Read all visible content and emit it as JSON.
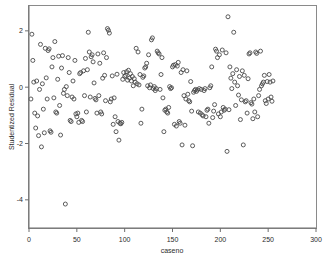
{
  "chart_data": {
    "type": "scatter",
    "title": "",
    "xlabel": "caseno",
    "ylabel": "Studentized Residual",
    "xlim": [
      0,
      300
    ],
    "ylim": [
      -5.0,
      2.9
    ],
    "xticks": [
      0,
      50,
      100,
      150,
      200,
      250,
      300
    ],
    "xtick_labels": [
      "0",
      "50",
      "100",
      "150",
      "200",
      "250",
      "300"
    ],
    "yticks": [
      2,
      0,
      -2,
      -4
    ],
    "ytick_labels": [
      "2",
      "0",
      "-2",
      "-4"
    ],
    "grid": false,
    "legend": null,
    "marker": "open-circle",
    "marker_color": "#4a4a4a",
    "marker_size": 4,
    "n_points": 250,
    "points": [
      [
        2,
        -0.42
      ],
      [
        3,
        1.88
      ],
      [
        4,
        0.95
      ],
      [
        5,
        0.18
      ],
      [
        6,
        -0.92
      ],
      [
        7,
        -1.45
      ],
      [
        8,
        0.22
      ],
      [
        9,
        -1.02
      ],
      [
        10,
        -1.72
      ],
      [
        11,
        -0.08
      ],
      [
        12,
        1.52
      ],
      [
        13,
        -2.12
      ],
      [
        14,
        0.12
      ],
      [
        15,
        -0.78
      ],
      [
        16,
        -1.62
      ],
      [
        17,
        1.38
      ],
      [
        18,
        0.33
      ],
      [
        19,
        -0.42
      ],
      [
        20,
        1.3
      ],
      [
        21,
        1.36
      ],
      [
        22,
        -1.55
      ],
      [
        23,
        -1.6
      ],
      [
        24,
        0.72
      ],
      [
        25,
        1.05
      ],
      [
        26,
        -0.38
      ],
      [
        27,
        1.62
      ],
      [
        28,
        -0.88
      ],
      [
        29,
        -0.92
      ],
      [
        30,
        0.28
      ],
      [
        31,
        1.1
      ],
      [
        32,
        -0.65
      ],
      [
        33,
        -1.7
      ],
      [
        34,
        0.68
      ],
      [
        35,
        1.12
      ],
      [
        36,
        -0.22
      ],
      [
        37,
        -0.08
      ],
      [
        38,
        -4.15
      ],
      [
        39,
        0.02
      ],
      [
        40,
        -0.3
      ],
      [
        41,
        1.05
      ],
      [
        42,
        0.52
      ],
      [
        43,
        -1.18
      ],
      [
        44,
        -1.22
      ],
      [
        45,
        -0.35
      ],
      [
        46,
        0.22
      ],
      [
        47,
        -0.42
      ],
      [
        48,
        0.95
      ],
      [
        49,
        -0.95
      ],
      [
        50,
        -1.05
      ],
      [
        51,
        -0.92
      ],
      [
        52,
        -1.25
      ],
      [
        53,
        0.48
      ],
      [
        54,
        0.52
      ],
      [
        55,
        -1.18
      ],
      [
        56,
        -1.22
      ],
      [
        57,
        0.58
      ],
      [
        58,
        -0.3
      ],
      [
        59,
        1.02
      ],
      [
        60,
        -0.88
      ],
      [
        61,
        0.62
      ],
      [
        62,
        1.95
      ],
      [
        63,
        1.25
      ],
      [
        64,
        -0.35
      ],
      [
        65,
        1.08
      ],
      [
        66,
        1.15
      ],
      [
        67,
        0.9
      ],
      [
        68,
        0.15
      ],
      [
        69,
        -0.4
      ],
      [
        70,
        -0.45
      ],
      [
        71,
        -0.92
      ],
      [
        72,
        1.18
      ],
      [
        73,
        -0.3
      ],
      [
        74,
        0.85
      ],
      [
        75,
        -0.88
      ],
      [
        76,
        -0.95
      ],
      [
        77,
        0.32
      ],
      [
        78,
        1.22
      ],
      [
        79,
        0.42
      ],
      [
        80,
        -0.48
      ],
      [
        81,
        1.05
      ],
      [
        82,
        2.08
      ],
      [
        83,
        2.02
      ],
      [
        84,
        1.92
      ],
      [
        85,
        -0.52
      ],
      [
        86,
        -0.42
      ],
      [
        87,
        0.4
      ],
      [
        88,
        -1.32
      ],
      [
        89,
        -0.38
      ],
      [
        90,
        -1.05
      ],
      [
        91,
        -1.58
      ],
      [
        92,
        0.46
      ],
      [
        93,
        -1.22
      ],
      [
        94,
        -1.88
      ],
      [
        95,
        -1.28
      ],
      [
        96,
        -1.3
      ],
      [
        97,
        -1.25
      ],
      [
        98,
        0.28
      ],
      [
        99,
        0.52
      ],
      [
        100,
        0.38
      ],
      [
        101,
        0.42
      ],
      [
        102,
        0.55
      ],
      [
        103,
        0.25
      ],
      [
        104,
        0.6
      ],
      [
        105,
        0.32
      ],
      [
        106,
        0.48
      ],
      [
        107,
        0.22
      ],
      [
        108,
        0.38
      ],
      [
        109,
        0.05
      ],
      [
        110,
        0.3
      ],
      [
        111,
        0.18
      ],
      [
        112,
        1.38
      ],
      [
        113,
        0.12
      ],
      [
        114,
        1.25
      ],
      [
        115,
        0.08
      ],
      [
        116,
        0.45
      ],
      [
        117,
        -1.28
      ],
      [
        118,
        -0.78
      ],
      [
        119,
        0.35
      ],
      [
        120,
        0.4
      ],
      [
        121,
        0.68
      ],
      [
        122,
        0.72
      ],
      [
        123,
        0.85
      ],
      [
        124,
        0.05
      ],
      [
        125,
        1.15
      ],
      [
        126,
        -0.02
      ],
      [
        127,
        0.08
      ],
      [
        128,
        1.68
      ],
      [
        129,
        1.75
      ],
      [
        130,
        -0.05
      ],
      [
        131,
        0.02
      ],
      [
        132,
        -0.12
      ],
      [
        133,
        -0.05
      ],
      [
        134,
        1.28
      ],
      [
        135,
        1.22
      ],
      [
        136,
        1.18
      ],
      [
        137,
        -0.08
      ],
      [
        138,
        0.45
      ],
      [
        139,
        1.05
      ],
      [
        140,
        -0.38
      ],
      [
        141,
        -1.58
      ],
      [
        142,
        -0.82
      ],
      [
        143,
        -0.78
      ],
      [
        144,
        -0.88
      ],
      [
        145,
        -0.92
      ],
      [
        146,
        -0.72
      ],
      [
        147,
        0.02
      ],
      [
        148,
        -0.05
      ],
      [
        149,
        -0.02
      ],
      [
        150,
        0.72
      ],
      [
        151,
        0.78
      ],
      [
        152,
        -1.32
      ],
      [
        153,
        0.8
      ],
      [
        154,
        -1.38
      ],
      [
        155,
        0.75
      ],
      [
        156,
        0.88
      ],
      [
        157,
        -1.22
      ],
      [
        158,
        -1.28
      ],
      [
        159,
        0.52
      ],
      [
        160,
        -2.05
      ],
      [
        161,
        0.62
      ],
      [
        162,
        -0.3
      ],
      [
        163,
        -1.35
      ],
      [
        164,
        -0.42
      ],
      [
        165,
        0.58
      ],
      [
        166,
        -0.25
      ],
      [
        167,
        -0.48
      ],
      [
        168,
        -0.52
      ],
      [
        169,
        0.2
      ],
      [
        170,
        -0.85
      ],
      [
        171,
        -2.08
      ],
      [
        172,
        -0.18
      ],
      [
        173,
        -0.12
      ],
      [
        174,
        -0.08
      ],
      [
        175,
        -0.15
      ],
      [
        176,
        -0.1
      ],
      [
        177,
        -0.88
      ],
      [
        178,
        -0.05
      ],
      [
        179,
        -0.92
      ],
      [
        180,
        -0.08
      ],
      [
        181,
        -0.98
      ],
      [
        182,
        -1.02
      ],
      [
        183,
        -0.12
      ],
      [
        184,
        -0.05
      ],
      [
        185,
        -1.05
      ],
      [
        186,
        -0.82
      ],
      [
        187,
        -0.78
      ],
      [
        188,
        -1.28
      ],
      [
        189,
        -0.02
      ],
      [
        190,
        0.05
      ],
      [
        191,
        0.72
      ],
      [
        192,
        -1.08
      ],
      [
        193,
        -0.85
      ],
      [
        194,
        -0.62
      ],
      [
        195,
        1.35
      ],
      [
        196,
        1.28
      ],
      [
        197,
        1.05
      ],
      [
        198,
        -0.95
      ],
      [
        199,
        1.15
      ],
      [
        200,
        -1.05
      ],
      [
        201,
        -0.88
      ],
      [
        202,
        1.32
      ],
      [
        203,
        -0.72
      ],
      [
        204,
        -0.82
      ],
      [
        205,
        -0.78
      ],
      [
        206,
        1.22
      ],
      [
        207,
        -2.28
      ],
      [
        208,
        2.5
      ],
      [
        209,
        -0.8
      ],
      [
        210,
        0.72
      ],
      [
        211,
        0.32
      ],
      [
        212,
        -0.05
      ],
      [
        213,
        0.48
      ],
      [
        214,
        1.95
      ],
      [
        215,
        0.18
      ],
      [
        216,
        -0.65
      ],
      [
        217,
        0.62
      ],
      [
        218,
        0.05
      ],
      [
        219,
        -0.28
      ],
      [
        220,
        0.38
      ],
      [
        221,
        -1.15
      ],
      [
        222,
        -0.45
      ],
      [
        223,
        0.58
      ],
      [
        224,
        -2.05
      ],
      [
        225,
        0.42
      ],
      [
        226,
        -0.52
      ],
      [
        227,
        -0.48
      ],
      [
        228,
        -0.92
      ],
      [
        229,
        0.3
      ],
      [
        230,
        1.18
      ],
      [
        231,
        1.22
      ],
      [
        232,
        -0.55
      ],
      [
        233,
        -0.6
      ],
      [
        234,
        -1.12
      ],
      [
        235,
        -0.42
      ],
      [
        236,
        -0.88
      ],
      [
        237,
        1.25
      ],
      [
        238,
        1.2
      ],
      [
        239,
        -1.05
      ],
      [
        240,
        -0.3
      ],
      [
        241,
        -0.08
      ],
      [
        242,
        1.28
      ],
      [
        243,
        0.05
      ],
      [
        244,
        0.12
      ],
      [
        245,
        0.18
      ],
      [
        246,
        0.42
      ],
      [
        247,
        -0.48
      ],
      [
        248,
        -0.58
      ],
      [
        249,
        0.2
      ],
      [
        250,
        -0.42
      ],
      [
        251,
        0.45
      ],
      [
        252,
        0.18
      ],
      [
        253,
        -0.35
      ],
      [
        254,
        -0.5
      ],
      [
        255,
        0.22
      ]
    ]
  }
}
